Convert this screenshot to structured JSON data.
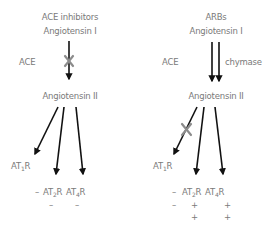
{
  "left_panel": {
    "title": "ACE inhibitors",
    "source": "Angiotensin I",
    "enzyme": "ACE",
    "product": "Angiotensin II",
    "receptors": {
      "r1_prefix": "AT",
      "r1_sub": "1",
      "r1_suffix": "R",
      "r2_prefix": "AT",
      "r2_sub": "2",
      "r2_suffix": "R",
      "r3_prefix": "AT",
      "r3_sub": "4",
      "r3_suffix": "R"
    },
    "signs": {
      "row0_lead": "–",
      "row1_r2": "–",
      "row1_r3": "–"
    },
    "blocked_step": "ACE conversion"
  },
  "right_panel": {
    "title": "ARBs",
    "source": "Angiotensin I",
    "enzyme_1": "ACE",
    "enzyme_2": "chymase",
    "product": "Angiotensin II",
    "receptors": {
      "r1_prefix": "AT",
      "r1_sub": "1",
      "r1_suffix": "R",
      "r2_prefix": "AT",
      "r2_sub": "2",
      "r2_suffix": "R",
      "r3_prefix": "AT",
      "r3_sub": "4",
      "r3_suffix": "R"
    },
    "signs": {
      "row0_lead": "–",
      "row1_lead": "–",
      "row1_r2": "+",
      "row1_r3": "+",
      "row2_r2": "+",
      "row2_r3": "+"
    },
    "blocked_step": "AT1R binding"
  },
  "colors": {
    "text": "#7a7a7a",
    "arrow": "#111111",
    "block_mark": "#8c8c8c"
  }
}
